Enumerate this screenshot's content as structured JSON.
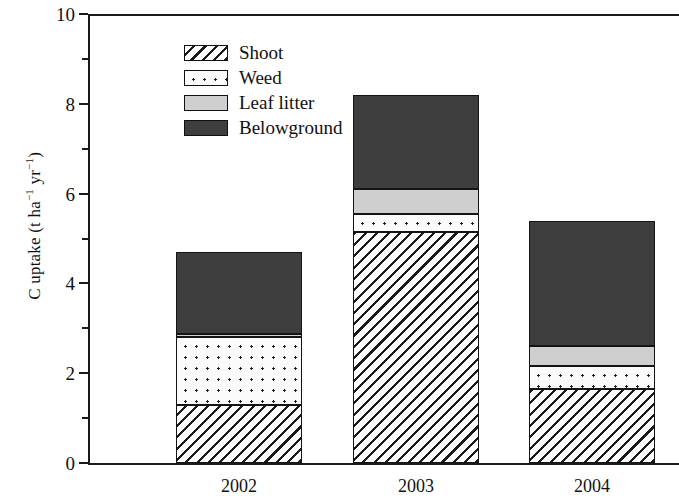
{
  "chart_data": {
    "type": "bar",
    "subtype": "stacked-bar",
    "title": "",
    "xlabel": "",
    "ylabel": "C uptake (t ha⁻¹ yr⁻¹)",
    "ylabel_parts": {
      "prefix": "C uptake (t ha",
      "sup1": "−1",
      "middle": " yr",
      "sup2": "−1",
      "suffix": ")"
    },
    "categories": [
      "2002",
      "2003",
      "2004"
    ],
    "series": [
      {
        "name": "Shoot",
        "values": [
          1.3,
          5.15,
          1.65
        ]
      },
      {
        "name": "Weed",
        "values": [
          1.5,
          0.4,
          0.5
        ]
      },
      {
        "name": "Leaf litter",
        "values": [
          0.08,
          0.55,
          0.45
        ]
      },
      {
        "name": "Belowground",
        "values": [
          1.82,
          2.1,
          2.8
        ]
      }
    ],
    "totals": [
      4.7,
      8.2,
      5.4
    ],
    "stack_order_bottom_to_top": [
      "Shoot",
      "Weed",
      "Leaf litter",
      "Belowground"
    ],
    "ylim": [
      0,
      10
    ],
    "y_ticks": [
      0,
      2,
      4,
      6,
      8,
      10
    ],
    "y_tick_labels": [
      "0",
      "2",
      "4",
      "6",
      "8",
      "10"
    ],
    "y_minor_ticks": [
      1,
      3,
      5,
      7,
      9
    ],
    "grid": false,
    "legend_position": "top-left",
    "legend": [
      {
        "label": "Shoot",
        "pattern": "diagonal-hatch"
      },
      {
        "label": "Weed",
        "pattern": "dotted"
      },
      {
        "label": "Leaf litter",
        "pattern": "light-gray-fill",
        "color": "#cfcfcf"
      },
      {
        "label": "Belowground",
        "pattern": "dark-gray-fill",
        "color": "#3e3e3e"
      }
    ],
    "colors": {
      "axis": "#1a1a1a",
      "leaf_litter": "#cfcfcf",
      "belowground": "#3e3e3e",
      "hatch": "#1a1a1a",
      "background": "#ffffff"
    }
  }
}
